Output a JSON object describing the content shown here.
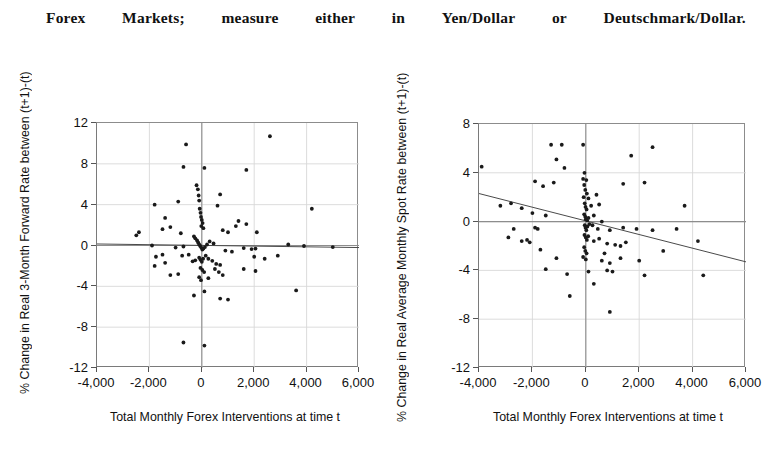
{
  "header": {
    "words": [
      "Forex",
      "Markets;",
      "measure",
      "either",
      "in",
      "Yen/Dollar",
      "or",
      "Deutschmark/Dollar."
    ]
  },
  "charts": [
    {
      "id": "forward-rate-chart",
      "ylabel": "% Change in Real 3-Month Forward Rate between (t+1)-(t)",
      "xlabel": "Total Monthly Forex Interventions at time t",
      "yticks": [
        "12",
        "8",
        "4",
        "0",
        "-4",
        "-8",
        "-12"
      ],
      "xticks": [
        "-4,000",
        "-2,000",
        "0",
        "2,000",
        "4,000",
        "6,000"
      ]
    },
    {
      "id": "spot-rate-chart",
      "ylabel": "% Change in Real Average Monthly Spot Rate between (t+1)-(t)",
      "xlabel": "Total Monthly Forex Interventions at time t",
      "yticks": [
        "8",
        "4",
        "0",
        "-4",
        "-8",
        "-12"
      ],
      "xticks": [
        "-4,000",
        "-2,000",
        "0",
        "2,000",
        "4,000",
        "6,000"
      ]
    }
  ],
  "chart_data": [
    {
      "type": "scatter",
      "title": "",
      "xlabel": "Total Monthly Forex Interventions at time t",
      "ylabel": "% Change in Real 3-Month Forward Rate between (t+1)-(t)",
      "xlim": [
        -4000,
        6000
      ],
      "ylim": [
        -12,
        12
      ],
      "xticks": [
        -4000,
        -2000,
        0,
        2000,
        4000,
        6000
      ],
      "yticks": [
        -12,
        -8,
        -4,
        0,
        4,
        8,
        12
      ],
      "grid": true,
      "legend": "none",
      "trendline": {
        "x": [
          -4000,
          6000
        ],
        "y": [
          0.15,
          -0.2
        ]
      },
      "zero_lines": {
        "horizontal": 0,
        "vertical": 0
      },
      "points": [
        [
          2600,
          10.7
        ],
        [
          -600,
          9.9
        ],
        [
          -700,
          7.7
        ],
        [
          100,
          7.6
        ],
        [
          1700,
          7.4
        ],
        [
          -1800,
          4.0
        ],
        [
          -900,
          4.3
        ],
        [
          700,
          5.0
        ],
        [
          -200,
          5.9
        ],
        [
          -150,
          5.5
        ],
        [
          -120,
          4.9
        ],
        [
          -100,
          4.4
        ],
        [
          -80,
          3.6
        ],
        [
          600,
          3.9
        ],
        [
          4200,
          3.6
        ],
        [
          -1400,
          2.7
        ],
        [
          1400,
          2.4
        ],
        [
          -1500,
          1.6
        ],
        [
          -1200,
          1.8
        ],
        [
          -50,
          3.2
        ],
        [
          -30,
          2.8
        ],
        [
          0,
          2.5
        ],
        [
          30,
          2.2
        ],
        [
          -20,
          1.9
        ],
        [
          60,
          1.7
        ],
        [
          -2400,
          1.3
        ],
        [
          -2500,
          1.0
        ],
        [
          -800,
          1.2
        ],
        [
          800,
          1.5
        ],
        [
          1000,
          1.3
        ],
        [
          1300,
          1.9
        ],
        [
          1700,
          2.1
        ],
        [
          2100,
          1.3
        ],
        [
          -300,
          0.9
        ],
        [
          -250,
          0.7
        ],
        [
          -180,
          0.5
        ],
        [
          -140,
          0.3
        ],
        [
          -100,
          0.1
        ],
        [
          -60,
          -0.05
        ],
        [
          -20,
          -0.2
        ],
        [
          20,
          -0.4
        ],
        [
          60,
          -0.3
        ],
        [
          120,
          -0.15
        ],
        [
          200,
          0.1
        ],
        [
          300,
          0.4
        ],
        [
          450,
          0.2
        ],
        [
          -700,
          -0.1
        ],
        [
          -1000,
          -0.2
        ],
        [
          -1900,
          0.0
        ],
        [
          3300,
          0.1
        ],
        [
          3900,
          -0.05
        ],
        [
          5000,
          -0.15
        ],
        [
          1600,
          -0.25
        ],
        [
          1900,
          -0.35
        ],
        [
          2050,
          -0.3
        ],
        [
          900,
          -0.5
        ],
        [
          1150,
          -0.6
        ],
        [
          -500,
          -0.9
        ],
        [
          -750,
          -1.0
        ],
        [
          -1500,
          -0.9
        ],
        [
          -1750,
          -1.1
        ],
        [
          -100,
          -1.2
        ],
        [
          -50,
          -1.4
        ],
        [
          0,
          -1.6
        ],
        [
          50,
          -1.3
        ],
        [
          150,
          -1.0
        ],
        [
          250,
          -1.3
        ],
        [
          400,
          -1.5
        ],
        [
          550,
          -1.8
        ],
        [
          700,
          -1.9
        ],
        [
          2000,
          -1.1
        ],
        [
          2400,
          -1.3
        ],
        [
          2900,
          -1.0
        ],
        [
          -350,
          -1.55
        ],
        [
          -250,
          -1.45
        ],
        [
          -1400,
          -1.7
        ],
        [
          -1800,
          -2.0
        ],
        [
          -50,
          -2.2
        ],
        [
          20,
          -2.4
        ],
        [
          90,
          -2.6
        ],
        [
          500,
          -2.3
        ],
        [
          650,
          -2.6
        ],
        [
          800,
          -2.9
        ],
        [
          1600,
          -2.3
        ],
        [
          2050,
          -2.5
        ],
        [
          -900,
          -2.8
        ],
        [
          -1200,
          -2.9
        ],
        [
          -100,
          -3.1
        ],
        [
          -30,
          -3.4
        ],
        [
          250,
          -3.2
        ],
        [
          3600,
          -4.4
        ],
        [
          100,
          -4.5
        ],
        [
          700,
          -5.2
        ],
        [
          1000,
          -5.3
        ],
        [
          -300,
          -4.9
        ],
        [
          -700,
          -9.5
        ],
        [
          100,
          -9.8
        ]
      ]
    },
    {
      "type": "scatter",
      "title": "",
      "xlabel": "Total Monthly Forex Interventions at time t",
      "ylabel": "% Change in Real Average Monthly Spot Rate between (t+1)-(t)",
      "xlim": [
        -4000,
        6000
      ],
      "ylim": [
        -12,
        8
      ],
      "xticks": [
        -4000,
        -2000,
        0,
        2000,
        4000,
        6000
      ],
      "yticks": [
        -12,
        -8,
        -4,
        0,
        4,
        8
      ],
      "grid": true,
      "legend": "none",
      "trendline": {
        "x": [
          -4000,
          6000
        ],
        "y": [
          2.3,
          -3.3
        ]
      },
      "zero_lines": {
        "horizontal": 0,
        "vertical": 0
      },
      "points": [
        [
          -3900,
          4.5
        ],
        [
          -1300,
          6.3
        ],
        [
          -900,
          6.3
        ],
        [
          -100,
          6.3
        ],
        [
          1700,
          5.4
        ],
        [
          2500,
          6.1
        ],
        [
          -1100,
          5.1
        ],
        [
          -800,
          4.4
        ],
        [
          -50,
          4.0
        ],
        [
          -1900,
          3.3
        ],
        [
          -1200,
          3.2
        ],
        [
          -1600,
          2.9
        ],
        [
          -100,
          3.5
        ],
        [
          -60,
          3.0
        ],
        [
          20,
          3.4
        ],
        [
          1400,
          3.1
        ],
        [
          2200,
          3.2
        ],
        [
          -20,
          2.6
        ],
        [
          40,
          2.3
        ],
        [
          -80,
          2.0
        ],
        [
          100,
          1.9
        ],
        [
          400,
          2.2
        ],
        [
          -2800,
          1.5
        ],
        [
          -3200,
          1.3
        ],
        [
          -2400,
          1.1
        ],
        [
          -40,
          1.5
        ],
        [
          -10,
          1.2
        ],
        [
          30,
          1.0
        ],
        [
          200,
          1.3
        ],
        [
          500,
          1.4
        ],
        [
          3700,
          1.3
        ],
        [
          -2000,
          0.7
        ],
        [
          -1500,
          0.5
        ],
        [
          -60,
          0.6
        ],
        [
          -20,
          0.4
        ],
        [
          0,
          0.2
        ],
        [
          50,
          0.1
        ],
        [
          100,
          0.3
        ],
        [
          300,
          0.5
        ],
        [
          600,
          0.0
        ],
        [
          -2700,
          -0.6
        ],
        [
          -1900,
          -0.5
        ],
        [
          -1800,
          -0.6
        ],
        [
          -40,
          -0.3
        ],
        [
          -10,
          -0.5
        ],
        [
          20,
          -0.7
        ],
        [
          60,
          -0.4
        ],
        [
          130,
          -0.2
        ],
        [
          250,
          -0.3
        ],
        [
          450,
          -0.6
        ],
        [
          900,
          -0.7
        ],
        [
          1400,
          -0.5
        ],
        [
          1900,
          -0.6
        ],
        [
          2500,
          -0.7
        ],
        [
          3400,
          -0.6
        ],
        [
          -2900,
          -1.3
        ],
        [
          -2400,
          -1.6
        ],
        [
          -2200,
          -1.5
        ],
        [
          -2100,
          -1.7
        ],
        [
          -50,
          -1.1
        ],
        [
          0,
          -1.3
        ],
        [
          40,
          -1.5
        ],
        [
          90,
          -1.2
        ],
        [
          300,
          -1.6
        ],
        [
          500,
          -1.4
        ],
        [
          800,
          -1.8
        ],
        [
          1100,
          -1.9
        ],
        [
          1300,
          -2.0
        ],
        [
          1500,
          -1.7
        ],
        [
          4200,
          -1.6
        ],
        [
          -1700,
          -2.3
        ],
        [
          -60,
          -2.1
        ],
        [
          -20,
          -2.4
        ],
        [
          30,
          -2.6
        ],
        [
          700,
          -2.6
        ],
        [
          2900,
          -2.4
        ],
        [
          -1100,
          -3.0
        ],
        [
          -100,
          -2.9
        ],
        [
          0,
          -3.1
        ],
        [
          600,
          -3.2
        ],
        [
          900,
          -3.4
        ],
        [
          1300,
          -3.0
        ],
        [
          2000,
          -3.2
        ],
        [
          -1500,
          -3.9
        ],
        [
          -700,
          -4.3
        ],
        [
          100,
          -4.1
        ],
        [
          800,
          -4.0
        ],
        [
          1000,
          -4.1
        ],
        [
          2200,
          -4.4
        ],
        [
          4400,
          -4.4
        ],
        [
          300,
          -5.1
        ],
        [
          -600,
          -6.1
        ],
        [
          900,
          -7.4
        ]
      ]
    }
  ]
}
